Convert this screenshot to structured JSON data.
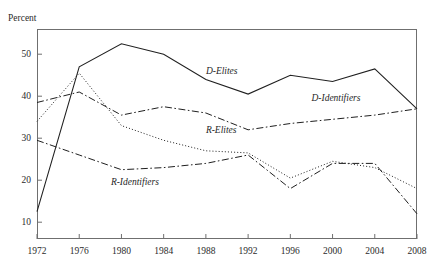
{
  "figure": {
    "cut_off_header": "        ",
    "y_axis_unit_label": "Percent"
  },
  "chart_data": {
    "type": "line",
    "title": "",
    "subtitle": "",
    "xlabel": "",
    "ylabel": "Percent",
    "x": [
      1972,
      1976,
      1980,
      1984,
      1988,
      1992,
      1996,
      2000,
      2004,
      2008
    ],
    "categories": [
      "1972",
      "1976",
      "1980",
      "1984",
      "1988",
      "1992",
      "1996",
      "2000",
      "2004",
      "2008"
    ],
    "xlim": [
      1972,
      2008
    ],
    "ylim": [
      6,
      56
    ],
    "yticks": [
      10,
      20,
      30,
      40,
      50
    ],
    "ytick_labels": [
      "10",
      "20",
      "30",
      "40",
      "50"
    ],
    "xticks": [
      1972,
      1976,
      1980,
      1984,
      1988,
      1992,
      1996,
      2000,
      2004,
      2008
    ],
    "grid": false,
    "legend": "inline-annotations",
    "series": [
      {
        "name": "D-Elites",
        "label": "D-Elites",
        "linestyle": "solid",
        "color": "#1f1f1f",
        "values": [
          12.5,
          47.0,
          52.5,
          50.0,
          44.0,
          40.5,
          45.0,
          43.5,
          46.5,
          37.0
        ]
      },
      {
        "name": "D-Identifiers",
        "label": "D-Identifiers",
        "linestyle": "dash-dot",
        "color": "#1f1f1f",
        "values": [
          38.5,
          41.0,
          35.5,
          37.5,
          36.0,
          32.0,
          33.5,
          34.5,
          35.5,
          37.0
        ]
      },
      {
        "name": "R-Elites",
        "label": "R-Elites",
        "linestyle": "dotted",
        "color": "#1f1f1f",
        "values": [
          34.0,
          45.5,
          33.0,
          29.5,
          27.0,
          26.5,
          20.5,
          24.5,
          23.0,
          18.0
        ]
      },
      {
        "name": "R-Identifiers",
        "label": "R-Identifiers",
        "linestyle": "dash-dot",
        "color": "#1f1f1f",
        "values": [
          29.5,
          26.0,
          22.5,
          23.0,
          24.0,
          26.0,
          18.0,
          24.0,
          24.0,
          12.0
        ]
      }
    ],
    "annotations": [
      {
        "text": "D-Elites",
        "x": 1988,
        "y": 45.5
      },
      {
        "text": "D-Identifiers",
        "x": 1998,
        "y": 39.0
      },
      {
        "text": "R-Elites",
        "x": 1988,
        "y": 31.5
      },
      {
        "text": "R-Identifiers",
        "x": 1979,
        "y": 19.0
      }
    ]
  }
}
